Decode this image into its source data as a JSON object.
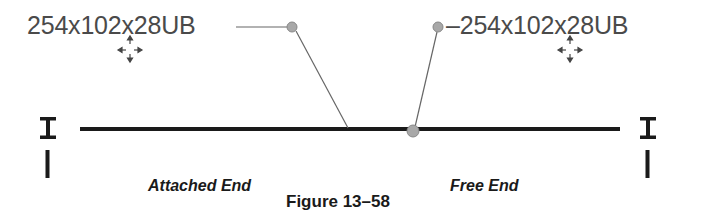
{
  "diagram": {
    "left_tag": {
      "text": "254x102x28UB",
      "leader_style": "line-then-diagonal"
    },
    "right_tag": {
      "text": "–254x102x28UB",
      "leader_style": "dot-dash"
    },
    "end_labels": {
      "attached": "Attached End",
      "free": "Free End"
    },
    "caption": "Figure 13–58",
    "icons": {
      "left_end_symbol": "i-beam-section-icon",
      "right_end_symbol": "i-beam-section-icon",
      "move_grips": "move-cursor-icon"
    },
    "colors": {
      "beam": "#1a1a1a",
      "leader": "#666666",
      "grip_dot": "#a8a8a8",
      "text": "#4a4a4a"
    }
  }
}
